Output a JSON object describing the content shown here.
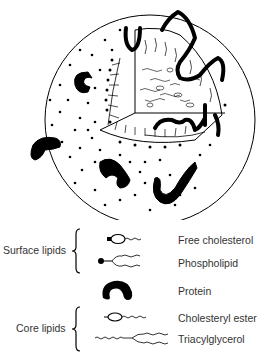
{
  "diagram": {
    "colors": {
      "ink": "#000000",
      "background": "#ffffff",
      "text": "#333333"
    }
  },
  "legend": {
    "groups": [
      {
        "label": "Surface lipids",
        "items": [
          "Free cholesterol",
          "Phospholipid"
        ]
      },
      {
        "label": "Core lipids",
        "items": [
          "Cholesteryl ester",
          "Triacylglycerol"
        ]
      }
    ],
    "items": [
      {
        "label": "Free cholesterol",
        "icon": "free-cholesterol-icon"
      },
      {
        "label": "Phospholipid",
        "icon": "phospholipid-icon"
      },
      {
        "label": "Protein",
        "icon": "protein-icon"
      },
      {
        "label": "Cholesteryl ester",
        "icon": "cholesteryl-ester-icon"
      },
      {
        "label": "Triacylglycerol",
        "icon": "triacylglycerol-icon"
      }
    ]
  }
}
